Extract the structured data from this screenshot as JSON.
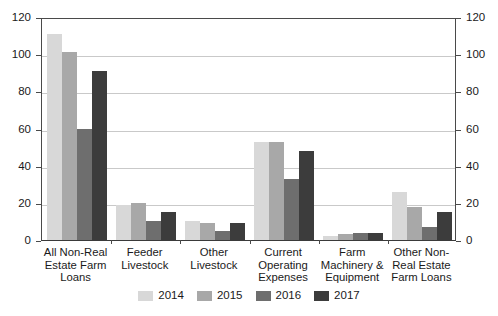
{
  "chart_data": {
    "type": "bar",
    "title": "",
    "subtitle": "",
    "xlabel": "",
    "ylabel": "",
    "ylim": [
      0,
      120
    ],
    "y2lim": [
      0,
      120
    ],
    "yticks": [
      "0",
      "20",
      "40",
      "60",
      "80",
      "100",
      "120"
    ],
    "y2ticks": [
      "0",
      "20",
      "40",
      "60",
      "80",
      "100",
      "120"
    ],
    "grid": true,
    "legend_position": "bottom",
    "categories": [
      "All Non-Real Estate Farm Loans",
      "Feeder Livestock",
      "Other Livestock",
      "Current Operating Expenses",
      "Farm Machinery & Equipment",
      "Other Non-Real Estate Farm Loans"
    ],
    "category_lines": [
      [
        "All Non-Real",
        "Estate Farm",
        "Loans"
      ],
      [
        "Feeder",
        "Livestock"
      ],
      [
        "Other",
        "Livestock"
      ],
      [
        "Current",
        "Operating",
        "Expenses"
      ],
      [
        "Farm",
        "Machinery &",
        "Equipment"
      ],
      [
        "Other Non-",
        "Real Estate",
        "Farm Loans"
      ]
    ],
    "series": [
      {
        "name": "2014",
        "color": "#d8d8d8",
        "values": [
          111,
          19,
          10,
          53,
          2,
          26
        ]
      },
      {
        "name": "2015",
        "color": "#a8a8a8",
        "values": [
          101,
          20,
          9,
          53,
          3,
          18
        ]
      },
      {
        "name": "2016",
        "color": "#6e6e6e",
        "values": [
          60,
          10,
          5,
          33,
          4,
          7
        ]
      },
      {
        "name": "2017",
        "color": "#3c3c3c",
        "values": [
          91,
          15,
          9,
          48,
          4,
          15
        ]
      }
    ]
  },
  "legend": {
    "items": [
      {
        "label": "2014",
        "color": "#d8d8d8"
      },
      {
        "label": "2015",
        "color": "#a8a8a8"
      },
      {
        "label": "2016",
        "color": "#6e6e6e"
      },
      {
        "label": "2017",
        "color": "#3c3c3c"
      }
    ]
  },
  "axes": {
    "left_ticks": [
      "120",
      "100",
      "80",
      "60",
      "40",
      "20",
      "0"
    ],
    "right_ticks": [
      "120",
      "100",
      "80",
      "60",
      "40",
      "20",
      "0"
    ]
  }
}
